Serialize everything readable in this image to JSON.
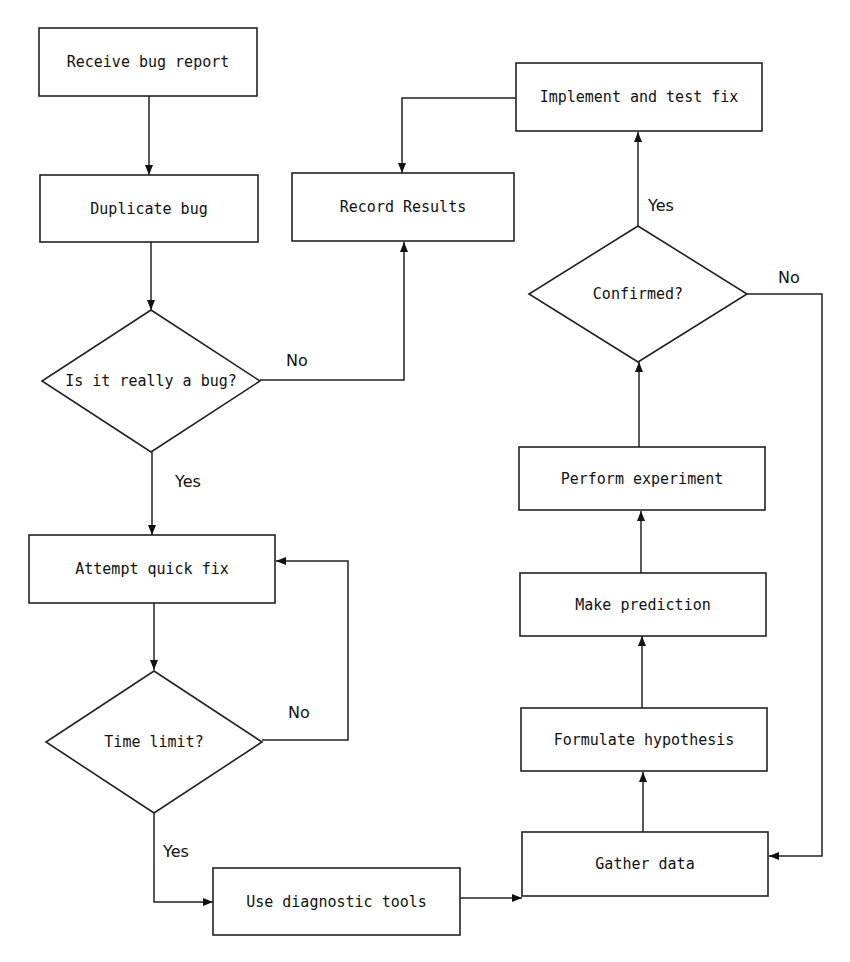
{
  "diagram": {
    "type": "flowchart",
    "nodes": [
      {
        "id": "receive",
        "shape": "process",
        "label": "Receive bug report"
      },
      {
        "id": "duplicate",
        "shape": "process",
        "label": "Duplicate bug"
      },
      {
        "id": "record",
        "shape": "process",
        "label": "Record Results"
      },
      {
        "id": "implement",
        "shape": "process",
        "label": "Implement and test fix"
      },
      {
        "id": "really",
        "shape": "decision",
        "label": "Is it really a bug?"
      },
      {
        "id": "attempt",
        "shape": "process",
        "label": "Attempt quick fix"
      },
      {
        "id": "timelimit",
        "shape": "decision",
        "label": "Time limit?"
      },
      {
        "id": "diagnostic",
        "shape": "process",
        "label": "Use diagnostic tools"
      },
      {
        "id": "gather",
        "shape": "process",
        "label": "Gather data"
      },
      {
        "id": "formulate",
        "shape": "process",
        "label": "Formulate hypothesis"
      },
      {
        "id": "predict",
        "shape": "process",
        "label": "Make prediction"
      },
      {
        "id": "experiment",
        "shape": "process",
        "label": "Perform experiment"
      },
      {
        "id": "confirmed",
        "shape": "decision",
        "label": "Confirmed?"
      }
    ],
    "edges": [
      {
        "from": "receive",
        "to": "duplicate",
        "label": ""
      },
      {
        "from": "duplicate",
        "to": "really",
        "label": ""
      },
      {
        "from": "really",
        "to": "record",
        "label": "No"
      },
      {
        "from": "really",
        "to": "attempt",
        "label": "Yes"
      },
      {
        "from": "attempt",
        "to": "timelimit",
        "label": ""
      },
      {
        "from": "timelimit",
        "to": "attempt",
        "label": "No"
      },
      {
        "from": "timelimit",
        "to": "diagnostic",
        "label": "Yes"
      },
      {
        "from": "diagnostic",
        "to": "gather",
        "label": ""
      },
      {
        "from": "gather",
        "to": "formulate",
        "label": ""
      },
      {
        "from": "formulate",
        "to": "predict",
        "label": ""
      },
      {
        "from": "predict",
        "to": "experiment",
        "label": ""
      },
      {
        "from": "experiment",
        "to": "confirmed",
        "label": ""
      },
      {
        "from": "confirmed",
        "to": "implement",
        "label": "Yes"
      },
      {
        "from": "confirmed",
        "to": "gather",
        "label": "No"
      },
      {
        "from": "implement",
        "to": "record",
        "label": ""
      }
    ]
  }
}
